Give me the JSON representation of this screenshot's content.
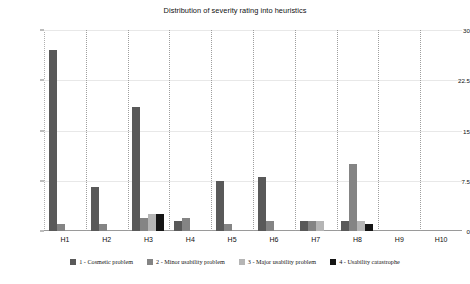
{
  "chart_data": {
    "type": "bar",
    "title": "Distribution of severity rating into heuristics",
    "xlabel": "",
    "ylabel": "",
    "ylim": [
      0,
      30
    ],
    "yticks": [
      0,
      7.5,
      15,
      22.5,
      30
    ],
    "ytick_labels": [
      "0",
      "7.5",
      "15",
      "22.5",
      "30"
    ],
    "grid": true,
    "grid_axis": "both",
    "legend_position": "bottom",
    "categories": [
      "H1",
      "H2",
      "H3",
      "H4",
      "H5",
      "H6",
      "H7",
      "H8",
      "H9",
      "H10"
    ],
    "series": [
      {
        "name": "1 - Cosmetic problem",
        "color": "#595959",
        "values": [
          27,
          6.5,
          18.5,
          1.5,
          7.5,
          8,
          1.5,
          1.5,
          0,
          0
        ]
      },
      {
        "name": "2 - Minor usability problem",
        "color": "#848484",
        "values": [
          1,
          1,
          2,
          2,
          1,
          1.5,
          1.5,
          10,
          0,
          0
        ]
      },
      {
        "name": "3 - Major usability problem",
        "color": "#b5b5b5",
        "values": [
          0,
          0,
          2.5,
          0,
          0,
          0,
          1.5,
          1.5,
          0,
          0
        ]
      },
      {
        "name": "4 - Usability catastrophe",
        "color": "#151515",
        "values": [
          0,
          0,
          2.5,
          0,
          0,
          0,
          0,
          1,
          0,
          0
        ]
      }
    ]
  },
  "legend": {
    "items": [
      {
        "label": "1 - Cosmetic problem",
        "color": "#595959"
      },
      {
        "label": "2 - Minor usability problem",
        "color": "#848484"
      },
      {
        "label": "3 - Major usability problem",
        "color": "#b5b5b5"
      },
      {
        "label": "4 - Usability catastrophe",
        "color": "#151515"
      }
    ]
  },
  "colors": {
    "background": "#ffffff",
    "axis": "#9a9a9a",
    "grid": "#9e9e9e",
    "text": "#101010"
  }
}
